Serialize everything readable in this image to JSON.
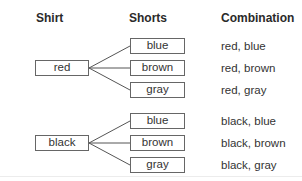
{
  "headers": {
    "shirt": "Shirt",
    "shorts": "Shorts",
    "combination": "Combination"
  },
  "tree": [
    {
      "shirt": "red",
      "shorts": [
        "blue",
        "brown",
        "gray"
      ],
      "combinations": [
        "red, blue",
        "red, brown",
        "red, gray"
      ]
    },
    {
      "shirt": "black",
      "shorts": [
        "blue",
        "brown",
        "gray"
      ],
      "combinations": [
        "black, blue",
        "black, brown",
        "black, gray"
      ]
    }
  ],
  "colors": {
    "box_border": "#666666",
    "line": "#555555",
    "text": "#333333"
  }
}
